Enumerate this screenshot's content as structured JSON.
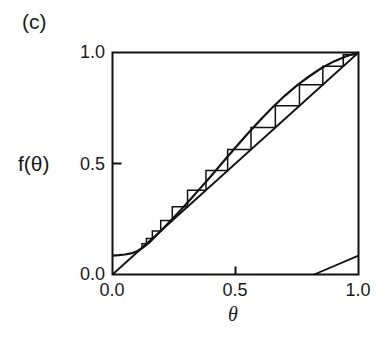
{
  "figure": {
    "panel_label": "(c)",
    "x_axis_label": "θ",
    "y_axis_label": "f(θ)",
    "x_ticks": [
      "0.0",
      "0.5",
      "1.0"
    ],
    "y_ticks": [
      "0.0",
      "0.5",
      "1.0"
    ],
    "line_color": "#111111",
    "background_color": "#ffffff"
  },
  "chart_data": {
    "type": "line",
    "title": "",
    "subtitle": "",
    "xlabel": "θ",
    "ylabel": "f(θ)",
    "xlim": [
      0.0,
      1.0
    ],
    "ylim": [
      0.0,
      1.0
    ],
    "grid": false,
    "legend": null,
    "xtick_values": [
      0.0,
      0.5,
      1.0
    ],
    "xtick_labels": [
      "0.0",
      "0.5",
      "1.0"
    ],
    "ytick_values": [
      0.0,
      0.5,
      1.0
    ],
    "ytick_labels": [
      "0.0",
      "0.5",
      "1.0"
    ],
    "annotations": [
      "(c)"
    ],
    "series": [
      {
        "name": "f(theta) return map",
        "type": "line",
        "x": [
          0.0,
          0.025,
          0.05,
          0.075,
          0.1,
          0.125,
          0.15,
          0.175,
          0.2,
          0.25,
          0.3,
          0.35,
          0.4,
          0.45,
          0.5,
          0.55,
          0.6,
          0.65,
          0.7,
          0.75,
          0.8,
          0.85,
          0.9,
          0.95,
          1.0
        ],
        "y": [
          0.085,
          0.087,
          0.09,
          0.095,
          0.105,
          0.122,
          0.145,
          0.172,
          0.2,
          0.258,
          0.318,
          0.38,
          0.443,
          0.508,
          0.572,
          0.635,
          0.695,
          0.752,
          0.805,
          0.852,
          0.893,
          0.93,
          0.96,
          0.983,
          1.0
        ]
      },
      {
        "name": "diagonal y = x",
        "type": "line",
        "x": [
          0.0,
          1.0
        ],
        "y": [
          0.0,
          1.0
        ]
      },
      {
        "name": "cobweb staircase",
        "type": "staircase",
        "points": [
          [
            0.12,
            0.12
          ],
          [
            0.12,
            0.138
          ],
          [
            0.138,
            0.138
          ],
          [
            0.138,
            0.162
          ],
          [
            0.162,
            0.162
          ],
          [
            0.162,
            0.196
          ],
          [
            0.196,
            0.196
          ],
          [
            0.196,
            0.243
          ],
          [
            0.243,
            0.243
          ],
          [
            0.243,
            0.305
          ],
          [
            0.305,
            0.305
          ],
          [
            0.305,
            0.38
          ],
          [
            0.38,
            0.38
          ],
          [
            0.38,
            0.468
          ],
          [
            0.468,
            0.468
          ],
          [
            0.468,
            0.563
          ],
          [
            0.563,
            0.563
          ],
          [
            0.563,
            0.662
          ],
          [
            0.662,
            0.662
          ],
          [
            0.662,
            0.76
          ],
          [
            0.76,
            0.76
          ],
          [
            0.76,
            0.855
          ],
          [
            0.855,
            0.855
          ],
          [
            0.855,
            0.938
          ],
          [
            0.938,
            0.938
          ],
          [
            0.938,
            0.99
          ],
          [
            0.99,
            0.99
          ],
          [
            1.0,
            1.0
          ]
        ]
      },
      {
        "name": "lower branch segment",
        "type": "line",
        "x": [
          0.82,
          1.0
        ],
        "y": [
          0.0,
          0.085
        ]
      }
    ]
  }
}
